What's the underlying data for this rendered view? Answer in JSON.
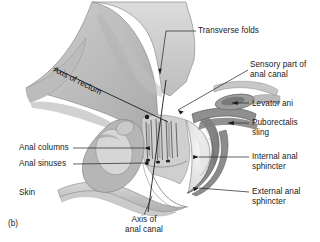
{
  "figure": {
    "letter": "(b)",
    "type": "anatomical-illustration"
  },
  "labels": {
    "transverse_folds": "Transverse folds",
    "sensory_part": "Sensory part of\nanal canal",
    "levator_ani": "Levator ani",
    "puborectalis_sling": "Puborectalis\nsling",
    "internal_anal_sphincter": "Internal anal\nsphincter",
    "external_anal_sphincter": "External anal\nsphincter",
    "anal_columns": "Anal columns",
    "anal_sinuses": "Anal sinuses",
    "skin": "Skin",
    "axis_of_rectum": "Axis of rectum",
    "axis_of_anal_canal": "Axis of\nanal canal"
  },
  "colors": {
    "background": "#ffffff",
    "text": "#19191b",
    "leader_line": "#3a3a3c",
    "tissue_light": "#d2d2d2",
    "tissue_mid": "#b4b4b4",
    "tissue_dark": "#8e8e8e",
    "tissue_darker": "#6e6e6e",
    "outline": "#55555a",
    "lumen": "#efefef"
  }
}
